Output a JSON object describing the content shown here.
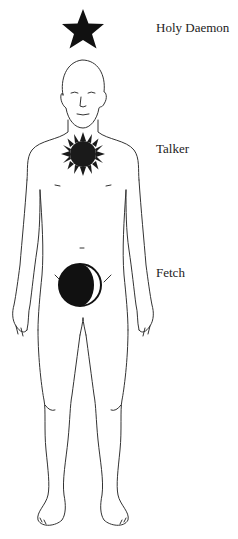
{
  "diagram": {
    "labels": [
      {
        "id": "holy-daemon",
        "text": "Holy Daemon"
      },
      {
        "id": "talker",
        "text": "Talker"
      },
      {
        "id": "fetch",
        "text": "Fetch"
      }
    ],
    "symbols": [
      {
        "id": "star",
        "name": "Holy Daemon symbol",
        "shape": "five-pointed star",
        "color": "#111111"
      },
      {
        "id": "sun",
        "name": "Talker symbol",
        "shape": "rayed sun disk",
        "color": "#1a1a1a"
      },
      {
        "id": "moon",
        "name": "Fetch symbol",
        "shape": "circle with crescent",
        "color": "#111111"
      }
    ],
    "figure": {
      "description": "front-facing standing human outline",
      "stroke": "#333333"
    }
  }
}
